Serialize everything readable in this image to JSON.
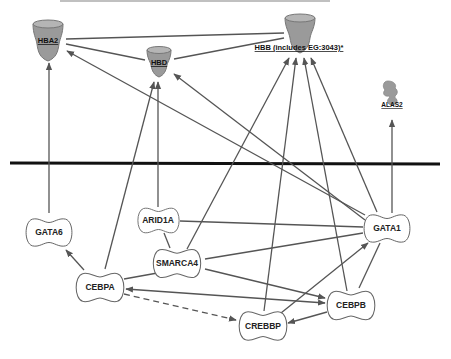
{
  "diagram": {
    "type": "gene-interaction-network",
    "divider": {
      "y": 163,
      "color": "#111111"
    },
    "nodes": [
      {
        "id": "HBA2",
        "label": "HBA2",
        "shape": "cup",
        "x": 48,
        "y": 42
      },
      {
        "id": "HBD",
        "label": "HBD",
        "shape": "cup",
        "x": 159,
        "y": 63
      },
      {
        "id": "HBB",
        "label": "HBB (includes EG:3043)*",
        "shape": "cup",
        "x": 300,
        "y": 35
      },
      {
        "id": "ALAS2",
        "label": "ALAS2",
        "shape": "enzyme",
        "x": 392,
        "y": 98
      },
      {
        "id": "GATA6",
        "label": "GATA6",
        "shape": "transcription-regulator",
        "x": 49,
        "y": 232
      },
      {
        "id": "ARID1A",
        "label": "ARID1A",
        "shape": "transcription-regulator",
        "x": 158,
        "y": 220
      },
      {
        "id": "SMARCA4",
        "label": "SMARCA4",
        "shape": "transcription-regulator",
        "x": 184,
        "y": 263
      },
      {
        "id": "CEBPA",
        "label": "CEBPA",
        "shape": "transcription-regulator",
        "x": 100,
        "y": 287
      },
      {
        "id": "GATA1",
        "label": "GATA1",
        "shape": "transcription-regulator",
        "x": 387,
        "y": 228
      },
      {
        "id": "CEBPB",
        "label": "CEBPB",
        "shape": "transcription-regulator",
        "x": 351,
        "y": 306
      },
      {
        "id": "CREBBP",
        "label": "CREBBP",
        "shape": "transcription-regulator",
        "x": 263,
        "y": 326
      }
    ],
    "edges": [
      {
        "from": "HBA2",
        "to": "HBB",
        "style": "solid",
        "arrow": false
      },
      {
        "from": "HBA2",
        "to": "HBD",
        "style": "solid",
        "arrow": false
      },
      {
        "from": "HBD",
        "to": "HBB",
        "style": "solid",
        "arrow": false
      },
      {
        "from": "GATA6",
        "to": "HBA2",
        "style": "solid",
        "arrow": true
      },
      {
        "from": "GATA1",
        "to": "HBA2",
        "style": "solid",
        "arrow": true
      },
      {
        "from": "CEBPA",
        "to": "HBD",
        "style": "solid",
        "arrow": true
      },
      {
        "from": "ARID1A",
        "to": "HBD",
        "style": "solid",
        "arrow": true
      },
      {
        "from": "GATA1",
        "to": "HBD",
        "style": "solid",
        "arrow": true
      },
      {
        "from": "SMARCA4",
        "to": "HBB",
        "style": "solid",
        "arrow": true
      },
      {
        "from": "CREBBP",
        "to": "HBB",
        "style": "solid",
        "arrow": true
      },
      {
        "from": "CEBPB",
        "to": "HBB",
        "style": "solid",
        "arrow": true
      },
      {
        "from": "GATA1",
        "to": "HBB",
        "style": "solid",
        "arrow": true
      },
      {
        "from": "GATA1",
        "to": "ALAS2",
        "style": "solid",
        "arrow": true
      },
      {
        "from": "CEBPA",
        "to": "GATA6",
        "style": "solid",
        "arrow": true
      },
      {
        "from": "ARID1A",
        "to": "SMARCA4",
        "style": "solid",
        "arrow": false
      },
      {
        "from": "ARID1A",
        "to": "GATA1",
        "style": "solid",
        "arrow": false
      },
      {
        "from": "SMARCA4",
        "to": "GATA1",
        "style": "solid",
        "arrow": false
      },
      {
        "from": "SMARCA4",
        "to": "CEBPA",
        "style": "solid",
        "arrow": false
      },
      {
        "from": "SMARCA4",
        "to": "CEBPB",
        "style": "solid",
        "arrow": true
      },
      {
        "from": "CEBPB",
        "to": "CEBPA",
        "style": "solid",
        "arrow": true
      },
      {
        "from": "CEBPA",
        "to": "CEBPB",
        "style": "solid",
        "arrow": true
      },
      {
        "from": "CEBPA",
        "to": "CREBBP",
        "style": "dashed",
        "arrow": true
      },
      {
        "from": "CREBBP",
        "to": "GATA1",
        "style": "solid",
        "arrow": true
      },
      {
        "from": "CEBPB",
        "to": "CREBBP",
        "style": "solid",
        "arrow": true
      },
      {
        "from": "GATA1",
        "to": "CEBPB",
        "style": "solid",
        "arrow": false
      }
    ]
  },
  "labels": {
    "HBA2": "HBA2",
    "HBD": "HBD",
    "HBB": "HBB (includes EG:3043)*",
    "ALAS2": "ALAS2",
    "GATA6": "GATA6",
    "ARID1A": "ARID1A",
    "SMARCA4": "SMARCA4",
    "CEBPA": "CEBPA",
    "GATA1": "GATA1",
    "CEBPB": "CEBPB",
    "CREBBP": "CREBBP"
  }
}
